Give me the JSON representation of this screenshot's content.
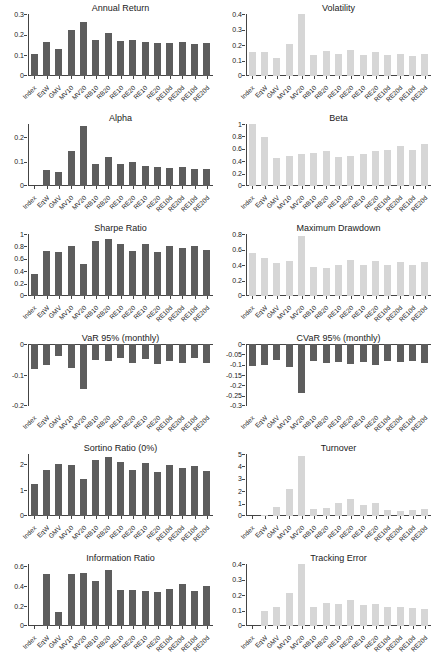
{
  "colors": {
    "dark_bar": "#5d5d5d",
    "light_bar": "#d6d6d6",
    "axis": "#444444",
    "text": "#222222"
  },
  "chart_data": {
    "type": "bar",
    "layout": "grid-6rows-2cols",
    "grid": false,
    "legend": "none",
    "shared_categories": [
      "Index",
      "EqW",
      "GMV",
      "MV10",
      "MV20",
      "RB10",
      "RB20",
      "RE10",
      "RE20",
      "RE10",
      "RE20",
      "RE10d",
      "RE20d",
      "RE10d",
      "RE20d"
    ],
    "charts": [
      {
        "title": "Annual Return",
        "bar_style": "dark",
        "ylim": [
          0,
          0.3
        ],
        "yticks": [
          0,
          0.1,
          0.2,
          0.3
        ],
        "values": [
          0.105,
          0.163,
          0.132,
          0.222,
          0.263,
          0.175,
          0.207,
          0.168,
          0.175,
          0.163,
          0.162,
          0.16,
          0.165,
          0.155,
          0.16
        ]
      },
      {
        "title": "Volatility",
        "bar_style": "light",
        "ylim": [
          0,
          0.4
        ],
        "yticks": [
          0,
          0.1,
          0.2,
          0.3,
          0.4
        ],
        "values": [
          0.155,
          0.152,
          0.115,
          0.205,
          0.4,
          0.138,
          0.163,
          0.14,
          0.168,
          0.135,
          0.155,
          0.133,
          0.145,
          0.13,
          0.145
        ]
      },
      {
        "title": "Alpha",
        "bar_style": "dark",
        "ylim": [
          0,
          0.255
        ],
        "yticks": [
          0,
          0.1,
          0.2
        ],
        "values": [
          0,
          0.065,
          0.056,
          0.145,
          0.245,
          0.091,
          0.12,
          0.09,
          0.1,
          0.082,
          0.078,
          0.073,
          0.077,
          0.071,
          0.068
        ]
      },
      {
        "title": "Beta",
        "bar_style": "light",
        "ylim": [
          0,
          1
        ],
        "yticks": [
          0,
          0.2,
          0.4,
          0.6,
          0.8,
          1
        ],
        "values": [
          1.0,
          0.79,
          0.455,
          0.485,
          0.52,
          0.54,
          0.565,
          0.475,
          0.49,
          0.52,
          0.565,
          0.575,
          0.65,
          0.58,
          0.675
        ]
      },
      {
        "title": "Sharpe Ratio",
        "bar_style": "dark",
        "ylim": [
          0,
          1
        ],
        "yticks": [
          0,
          0.2,
          0.4,
          0.6,
          0.8,
          1
        ],
        "values": [
          0.355,
          0.72,
          0.715,
          0.8,
          0.515,
          0.885,
          0.92,
          0.835,
          0.73,
          0.835,
          0.705,
          0.81,
          0.78,
          0.8,
          0.735
        ]
      },
      {
        "title": "Maximum Drawdown",
        "bar_style": "light",
        "ylim": [
          0,
          0.8
        ],
        "yticks": [
          0,
          0.2,
          0.4,
          0.6,
          0.8
        ],
        "values": [
          0.555,
          0.485,
          0.425,
          0.455,
          0.775,
          0.37,
          0.365,
          0.395,
          0.465,
          0.395,
          0.45,
          0.405,
          0.435,
          0.405,
          0.44
        ]
      },
      {
        "title": "VaR 95% (monthly)",
        "bar_style": "dark",
        "ylim": [
          -0.2,
          0
        ],
        "yticks": [
          0,
          -0.1,
          -0.2
        ],
        "values": [
          -0.08,
          -0.068,
          -0.04,
          -0.078,
          -0.145,
          -0.052,
          -0.055,
          -0.045,
          -0.062,
          -0.048,
          -0.065,
          -0.055,
          -0.06,
          -0.045,
          -0.06
        ]
      },
      {
        "title": "CVaR 95% (monthly)",
        "bar_style": "dark",
        "ylim": [
          -0.3,
          0
        ],
        "yticks": [
          0,
          -0.05,
          -0.1,
          -0.15,
          -0.2,
          -0.25,
          -0.3
        ],
        "values": [
          -0.105,
          -0.1,
          -0.075,
          -0.11,
          -0.235,
          -0.08,
          -0.09,
          -0.085,
          -0.095,
          -0.085,
          -0.1,
          -0.08,
          -0.085,
          -0.082,
          -0.09
        ]
      },
      {
        "title": "Sortino Ratio (0%)",
        "bar_style": "dark",
        "ylim": [
          0,
          2.4
        ],
        "yticks": [
          0,
          1,
          2
        ],
        "values": [
          1.22,
          1.78,
          2.02,
          1.97,
          1.43,
          2.18,
          2.28,
          2.08,
          1.78,
          2.04,
          1.72,
          1.98,
          1.85,
          1.95,
          1.75
        ]
      },
      {
        "title": "Turnover",
        "bar_style": "light",
        "ylim": [
          0,
          5
        ],
        "yticks": [
          0,
          1,
          2,
          3,
          4,
          5
        ],
        "values": [
          0,
          0.08,
          0.7,
          2.2,
          4.85,
          0.6,
          0.65,
          1.05,
          1.4,
          0.85,
          1.05,
          0.45,
          0.42,
          0.5,
          0.55
        ]
      },
      {
        "title": "Information Ratio",
        "bar_style": "dark",
        "ylim": [
          0,
          0.62
        ],
        "yticks": [
          0,
          0.2,
          0.4,
          0.6
        ],
        "values": [
          0,
          0.525,
          0.145,
          0.52,
          0.53,
          0.45,
          0.565,
          0.36,
          0.365,
          0.355,
          0.34,
          0.37,
          0.425,
          0.35,
          0.4
        ]
      },
      {
        "title": "Tracking Error",
        "bar_style": "light",
        "ylim": [
          0,
          0.4
        ],
        "yticks": [
          0,
          0.1,
          0.2,
          0.3,
          0.4
        ],
        "values": [
          0,
          0.095,
          0.125,
          0.21,
          0.4,
          0.125,
          0.15,
          0.145,
          0.17,
          0.135,
          0.14,
          0.12,
          0.12,
          0.115,
          0.11
        ]
      }
    ]
  }
}
